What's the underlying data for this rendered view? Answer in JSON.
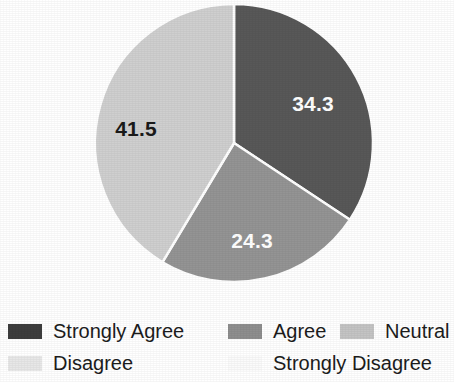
{
  "chart_data": {
    "type": "pie",
    "title": "",
    "subtitle": "",
    "xlabel": "",
    "ylabel": "",
    "grid": false,
    "legend_position": "bottom",
    "value_suffix": "",
    "categories": [
      "Strongly Agree",
      "Agree",
      "Neutral",
      "Disagree",
      "Strongly Disagree"
    ],
    "values": [
      34.3,
      24.3,
      41.5,
      0,
      0
    ],
    "colors": [
      "#585858",
      "#949494",
      "#cfcfcf",
      "#ececec",
      "#fafafa"
    ],
    "start_angle_deg": 0,
    "direction": "clockwise",
    "slices": [
      {
        "label": "Strongly Agree",
        "value": 34.3,
        "display": "34.3",
        "color": "#585858",
        "label_color": "on-dark",
        "show_label": true,
        "start_deg": 0,
        "end_deg": 123.48,
        "label_x": 313,
        "label_y": 104
      },
      {
        "label": "Agree",
        "value": 24.3,
        "display": "24.3",
        "color": "#949494",
        "label_color": "on-dark",
        "show_label": true,
        "start_deg": 123.48,
        "end_deg": 210.96,
        "label_x": 252,
        "label_y": 241
      },
      {
        "label": "Neutral",
        "value": 41.5,
        "display": "41.5",
        "color": "#cfcfcf",
        "label_color": "on-light",
        "show_label": true,
        "start_deg": 210.96,
        "end_deg": 360,
        "label_x": 136,
        "label_y": 129
      },
      {
        "label": "Disagree",
        "value": 0,
        "display": "",
        "color": "#ececec",
        "label_color": "on-light",
        "show_label": false,
        "start_deg": 360,
        "end_deg": 360,
        "label_x": 0,
        "label_y": 0
      },
      {
        "label": "Strongly Disagree",
        "value": 0,
        "display": "",
        "color": "#fafafa",
        "label_color": "on-light",
        "show_label": false,
        "start_deg": 360,
        "end_deg": 360,
        "label_x": 0,
        "label_y": 0
      }
    ],
    "geometry": {
      "center_x": 234,
      "center_y": 143,
      "radius": 139,
      "separator_color": "#ffffff",
      "separator_width": 2.5
    }
  },
  "legend": {
    "rows": [
      [
        {
          "id": "strongly-agree",
          "label": "Strongly Agree",
          "color": "#3d3d3d"
        },
        {
          "id": "agree",
          "label": "Agree",
          "color": "#8e8e8e"
        },
        {
          "id": "neutral",
          "label": "Neutral",
          "color": "#c4c4c4"
        }
      ],
      [
        {
          "id": "disagree",
          "label": "Disagree",
          "color": "#e7e7e7"
        },
        {
          "id": "strongly-disagree",
          "label": "Strongly Disagree",
          "color": "#fbfbfb"
        }
      ]
    ]
  }
}
